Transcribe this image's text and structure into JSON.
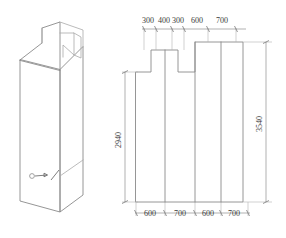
{
  "drawing": {
    "title": "",
    "background_color": "#ffffff",
    "line_color": "#8a8a8a",
    "dimension_line_color": "#8f8f8f",
    "extension_line_color": "#b4b4b4",
    "text_color": "#3a3a3a"
  },
  "isometric_view": {
    "name": "isometric-stepped-block",
    "marker": {
      "symbol_name": "section-arrow",
      "label": ""
    }
  },
  "elevation_view": {
    "name": "stepped-elevation",
    "panel_count": 4
  },
  "dimensions": {
    "top": {
      "position": "top",
      "units_note": "",
      "values": [
        "300",
        "400",
        "300",
        "600",
        "700"
      ]
    },
    "bottom": {
      "position": "bottom",
      "units_note": "",
      "values": [
        "600",
        "700",
        "600",
        "700"
      ]
    },
    "left_vertical": {
      "position": "left",
      "value": "2940",
      "orientation": "rotated-90"
    },
    "right_vertical": {
      "position": "right",
      "value": "3540",
      "orientation": "rotated-90"
    }
  }
}
